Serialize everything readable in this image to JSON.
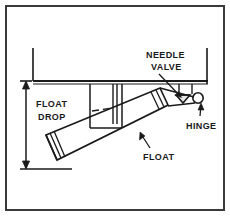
{
  "figure": {
    "kind": "technical-line-drawing",
    "background_color": "#ffffff",
    "line_color": "#1a1a1a",
    "border": {
      "name": "figure-border",
      "color": "#3a3a3a",
      "width_px": 2,
      "x": 5,
      "y": 5,
      "w": 220,
      "h": 206
    }
  },
  "labels": {
    "needle_valve_line1": "NEEDLE",
    "needle_valve_line2": "VALVE",
    "hinge": "HINGE",
    "float": "FLOAT",
    "float_drop_line1": "FLOAT",
    "float_drop_line2": "DROP"
  },
  "parts": {
    "bowl": {
      "name": "float-bowl",
      "description": "Inverted carburetor bowl body shown with left wall, flat floor and right wall"
    },
    "channel": {
      "name": "fuel-channel",
      "description": "Rectangular channel projecting down from bowl floor"
    },
    "standpipe": {
      "name": "standpipe-tube",
      "description": "Narrow vertical double-line tube beside the channel"
    },
    "float": {
      "name": "float-body",
      "description": "Elongated tilted rectangular float with seam lines at the left end"
    },
    "needle_valve": {
      "name": "needle-valve",
      "description": "Small conical needle valve at the right under the bowl floor"
    },
    "hinge": {
      "name": "hinge-pin",
      "description": "Small circular hinge pin at the float pivot"
    },
    "dimension": {
      "name": "float-drop-dimension",
      "description": "Vertical double-arrow dimension line at the left marking float drop distance"
    }
  },
  "leaders": {
    "needle_valve_leader": "line from NEEDLE VALVE text to the needle valve seat",
    "hinge_leader": "line from HINGE text up to the hinge pin",
    "float_leader": "line from FLOAT text up-left to the float body"
  }
}
